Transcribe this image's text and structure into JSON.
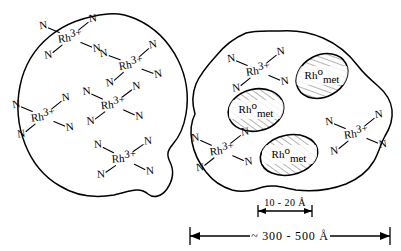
{
  "figure": {
    "background_color": "#ffffff",
    "line_color": "#000000",
    "width": 401,
    "height": 251
  },
  "labels": {
    "ligand": "N",
    "ion_element": "Rh",
    "ion_charge": "3+",
    "metal_element": "Rh",
    "metal_superscript": "o",
    "metal_subscript": "met"
  },
  "blobs": [
    {
      "name": "left-blob",
      "description": "Support particle containing only dispersed Rh3+ ions",
      "complex_count": 5,
      "cluster_count": 0
    },
    {
      "name": "right-blob",
      "description": "Support particle containing Rh3+ ions plus metallic Rh clusters",
      "complex_count": 3,
      "cluster_count": 3
    }
  ],
  "left_complexes": [
    {
      "cx": 70,
      "cy": 37,
      "rot": -8
    },
    {
      "cx": 131,
      "cy": 64,
      "rot": -10
    },
    {
      "cx": 113,
      "cy": 104,
      "rot": -6
    },
    {
      "cx": 43,
      "cy": 116,
      "rot": -8
    },
    {
      "cx": 124,
      "cy": 158,
      "rot": -4
    }
  ],
  "right_complexes": [
    {
      "cx": 258,
      "cy": 70,
      "rot": -8
    },
    {
      "cx": 222,
      "cy": 150,
      "rot": -7
    },
    {
      "cx": 356,
      "cy": 133,
      "rot": -8
    }
  ],
  "metal_clusters": [
    {
      "cx": 322,
      "cy": 76,
      "rx": 27,
      "ry": 21,
      "rot": -28
    },
    {
      "cx": 256,
      "cy": 110,
      "rx": 28,
      "ry": 21,
      "rot": -12
    },
    {
      "cx": 289,
      "cy": 155,
      "rx": 29,
      "ry": 20,
      "rot": -12
    }
  ],
  "scale_bars": {
    "cluster": {
      "text": "10 - 20 Å",
      "value_min": 10,
      "value_max": 20,
      "unit": "Å",
      "x_start": 258,
      "x_end": 312,
      "y": 211
    },
    "particle": {
      "text": "~ 300 - 500 Å",
      "approx": "~",
      "value_min": 300,
      "value_max": 500,
      "unit": "Å",
      "x_start": 190,
      "x_end": 390,
      "y": 236
    }
  }
}
